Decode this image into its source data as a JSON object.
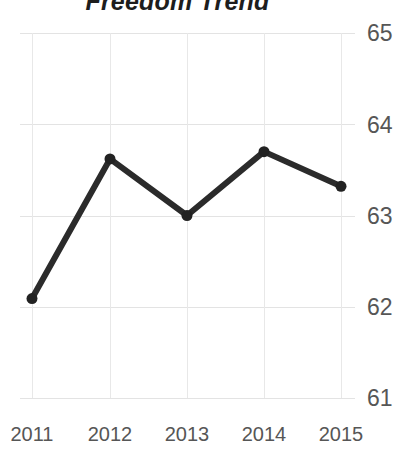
{
  "chart_data": {
    "type": "line",
    "title": "Freedom Trend",
    "xlabel": "",
    "ylabel": "",
    "categories": [
      "2011",
      "2012",
      "2013",
      "2014",
      "2015"
    ],
    "values": [
      62.09,
      63.62,
      63.0,
      63.7,
      63.32
    ],
    "series": [
      {
        "name": "Freedom",
        "values": [
          62.09,
          63.62,
          63.0,
          63.7,
          63.32
        ]
      }
    ],
    "ylim": [
      61,
      65
    ],
    "y_ticks": [
      "61",
      "62",
      "63",
      "64",
      "65"
    ],
    "x_ticks": [
      "2011",
      "2012",
      "2013",
      "2014",
      "2015"
    ],
    "grid": true,
    "legend": "none",
    "y_axis_position": "right",
    "marker": "circle",
    "colors": {
      "line": "#2b2b2b",
      "marker": "#222222",
      "grid": "#e3e3e3",
      "tick_label": "#565656",
      "title": "#1d1d1d",
      "background": "#ffffff"
    }
  }
}
